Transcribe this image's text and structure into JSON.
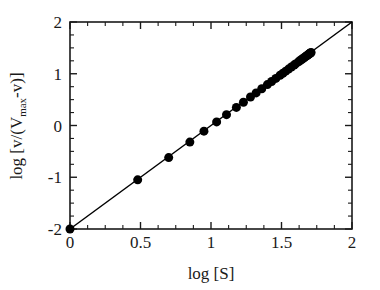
{
  "chart_data": {
    "type": "scatter",
    "title": "",
    "xlabel": "log [S]",
    "ylabel": "log [v/(V",
    "ylabel_sub": "max",
    "ylabel_tail": "-v)]",
    "xlim": [
      0,
      2
    ],
    "ylim": [
      -2,
      2
    ],
    "grid": false,
    "legend": "none",
    "xticks": [
      "0",
      "0.5",
      "1",
      "1.5",
      "2"
    ],
    "xtick_values": [
      0,
      0.5,
      1,
      1.5,
      2
    ],
    "yticks": [
      "2",
      "1",
      "0",
      "-1",
      "-2"
    ],
    "ytick_values": [
      2,
      1,
      0,
      -1,
      -2
    ],
    "minor_tick_interval_x": 0.125,
    "minor_tick_interval_y": 0.25,
    "marker": "filled-circle",
    "marker_color": "#000000",
    "marker_size": 9,
    "line_color": "#000000",
    "fit_line": {
      "slope": 2.0,
      "intercept": -2.0,
      "x_start": 0,
      "y_start": -2,
      "x_end": 2,
      "y_end": 2
    },
    "x": [
      0.0,
      0.48,
      0.7,
      0.85,
      0.95,
      1.04,
      1.11,
      1.18,
      1.23,
      1.28,
      1.32,
      1.36,
      1.4,
      1.43,
      1.46,
      1.49,
      1.51,
      1.53,
      1.55,
      1.57,
      1.59,
      1.6,
      1.62,
      1.63,
      1.64,
      1.65,
      1.66,
      1.67,
      1.675,
      1.68,
      1.685,
      1.69,
      1.695,
      1.7,
      1.705,
      1.71
    ],
    "y": [
      -2.0,
      -1.05,
      -0.62,
      -0.32,
      -0.11,
      0.07,
      0.21,
      0.35,
      0.45,
      0.55,
      0.63,
      0.71,
      0.79,
      0.85,
      0.91,
      0.97,
      1.01,
      1.05,
      1.09,
      1.13,
      1.17,
      1.19,
      1.23,
      1.25,
      1.27,
      1.29,
      1.31,
      1.33,
      1.34,
      1.35,
      1.36,
      1.37,
      1.38,
      1.39,
      1.4,
      1.41
    ]
  },
  "axes": {
    "x_title": "log [S]",
    "y_title_prefix": "log [v/(V",
    "y_title_sub": "max",
    "y_title_suffix": "-v)]"
  }
}
